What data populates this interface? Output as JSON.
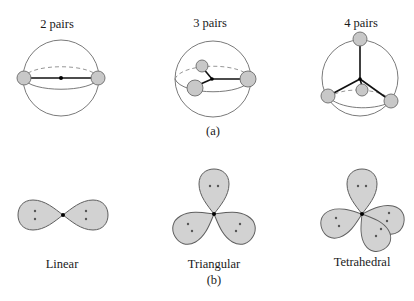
{
  "figure": {
    "part_a": {
      "label": "(a)",
      "panels": [
        {
          "title": "2 pairs",
          "pairs": 2
        },
        {
          "title": "3 pairs",
          "pairs": 3
        },
        {
          "title": "4 pairs",
          "pairs": 4
        }
      ]
    },
    "part_b": {
      "label": "(b)",
      "panels": [
        {
          "title": "Linear",
          "lobes": 2
        },
        {
          "title": "Triangular",
          "lobes": 3
        },
        {
          "title": "Tetrahedral",
          "lobes": 4
        }
      ]
    },
    "colors": {
      "ball_fill": "#c8c8c8",
      "lobe_fill": "#d2d2d2",
      "outline": "#5e5e5e",
      "bond": "#111111"
    }
  }
}
